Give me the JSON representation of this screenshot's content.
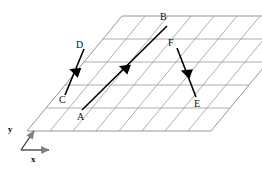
{
  "figure": {
    "background_color": "#ffffff",
    "grid_color": "#9a9a9a",
    "vector_color": "#000000",
    "axis_color": "#3a3a3a",
    "label_color": "#111111"
  },
  "lattice": {
    "rows": 5,
    "columns": 8,
    "shape": "parallelogram",
    "origin": {
      "x": 27,
      "y": 131
    },
    "a_vector": {
      "dx": 23.0,
      "dy": 0.0
    },
    "b_vector": {
      "dx": 19.0,
      "dy": -23.0
    }
  },
  "axes": {
    "x": {
      "label": "x",
      "start": {
        "x": 21,
        "y": 150
      },
      "end": {
        "x": 49,
        "y": 150
      },
      "label_pos": {
        "x": 31,
        "y": 155
      }
    },
    "y": {
      "label": "y",
      "start": {
        "x": 21,
        "y": 150
      },
      "end": {
        "x": 34,
        "y": 131
      },
      "label_pos": {
        "x": 8,
        "y": 125
      }
    }
  },
  "points": [
    {
      "id": "A",
      "label": "A",
      "x": 82,
      "y": 110,
      "label_x": 77,
      "label_y": 112
    },
    {
      "id": "B",
      "label": "B",
      "x": 167,
      "y": 26,
      "label_x": 160,
      "label_y": 12
    },
    {
      "id": "C",
      "label": "C",
      "x": 65,
      "y": 95,
      "label_x": 59,
      "label_y": 95
    },
    {
      "id": "D",
      "label": "D",
      "x": 84,
      "y": 49,
      "label_x": 76,
      "label_y": 40
    },
    {
      "id": "E",
      "label": "E",
      "x": 196,
      "y": 97,
      "label_x": 194,
      "label_y": 99
    },
    {
      "id": "F",
      "label": "F",
      "x": 177,
      "y": 48,
      "label_x": 168,
      "label_y": 38
    }
  ],
  "vectors": [
    {
      "name": "vector-c-to-d",
      "from": "C",
      "to": "D",
      "head_t": 0.52,
      "head_angle_deg": 200
    },
    {
      "name": "vector-a-to-b",
      "from": "A",
      "to": "B",
      "head_t": 0.5,
      "head_angle_deg": 200
    },
    {
      "name": "vector-f-to-e",
      "from": "F",
      "to": "E",
      "head_t": 0.5,
      "head_angle_deg": 200
    }
  ],
  "chart_data": {
    "type": "scatter",
    "xlabel": "x",
    "ylabel": "y",
    "grid": true,
    "legend": "none",
    "categories": [
      "A",
      "B",
      "C",
      "D",
      "E",
      "F"
    ],
    "series": [
      {
        "name": "labelled lattice points",
        "points": [
          {
            "label": "A",
            "x": 82,
            "y": 110
          },
          {
            "label": "B",
            "x": 167,
            "y": 26
          },
          {
            "label": "C",
            "x": 65,
            "y": 95
          },
          {
            "label": "D",
            "x": 84,
            "y": 49
          },
          {
            "label": "E",
            "x": 196,
            "y": 97
          },
          {
            "label": "F",
            "x": 177,
            "y": 48
          }
        ]
      },
      {
        "name": "vectors",
        "segments": [
          {
            "from": "C",
            "to": "D"
          },
          {
            "from": "A",
            "to": "B"
          },
          {
            "from": "F",
            "to": "E"
          }
        ]
      }
    ],
    "annotations": [
      "x",
      "y",
      "A",
      "B",
      "C",
      "D",
      "E",
      "F"
    ]
  }
}
